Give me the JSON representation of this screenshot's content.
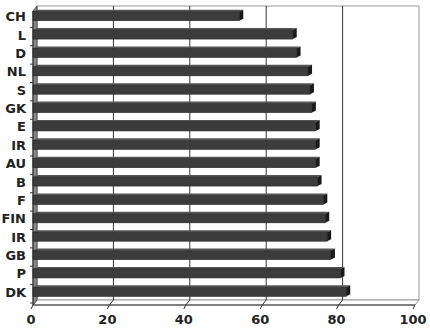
{
  "chart_data": {
    "type": "bar",
    "orientation": "horizontal",
    "style": "3d",
    "title": "",
    "xlabel": "",
    "ylabel": "",
    "categories": [
      "CH",
      "L",
      "D",
      "NL",
      "S",
      "GK",
      "E",
      "IR",
      "AU",
      "B",
      "F",
      "FIN",
      "IR",
      "GB",
      "P",
      "DK"
    ],
    "values": [
      54,
      68,
      69,
      72,
      72.5,
      73,
      74,
      74,
      74,
      74.5,
      76,
      76.5,
      77,
      78,
      80.5,
      82
    ],
    "xlim": [
      0,
      100
    ],
    "xticks": [
      0,
      20,
      40,
      60,
      80,
      100
    ],
    "xtick_labels": [
      "0",
      "20",
      "40",
      "60",
      "80",
      "100"
    ],
    "grid": true,
    "legend": null,
    "colors": {
      "bar": "#3c3c3c",
      "bar_top": "#555555",
      "bar_end": "#1a1a1a",
      "grid": "#333333",
      "background": "#ffffff"
    }
  }
}
